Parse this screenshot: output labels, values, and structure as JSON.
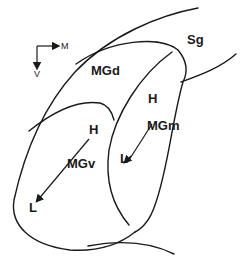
{
  "diagram": {
    "orientation": {
      "horizontal_label": "M",
      "vertical_label": "V"
    },
    "regions": {
      "dorsal": "MGd",
      "ventral": "MGv",
      "medial": "MGm",
      "suprageniculate": "Sg"
    },
    "gradients": {
      "mgv": {
        "start": "H",
        "end": "L"
      },
      "mgm": {
        "start": "H",
        "end": "L"
      }
    },
    "colors": {
      "line": "#1a1a1a",
      "background": "#ffffff"
    }
  }
}
